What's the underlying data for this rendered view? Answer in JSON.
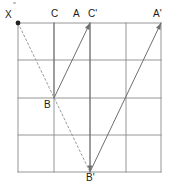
{
  "figure": {
    "canvas": {
      "width": 170,
      "height": 182,
      "background": "#ffffff"
    },
    "grid": {
      "x_lines": [
        18,
        54,
        90,
        126,
        161
      ],
      "y_lines": [
        23,
        60,
        98,
        135,
        172
      ],
      "columns": 4,
      "rows": 4,
      "stroke": "#8a8a8a",
      "stroke_width": 0.9
    },
    "points": [
      {
        "id": "X",
        "label": "X",
        "x": 18,
        "y": 23,
        "dot": true,
        "label_dx": -13,
        "label_dy": -13
      },
      {
        "id": "C",
        "label": "C",
        "x": 54,
        "y": 23,
        "dot": false,
        "label_dx": -3,
        "label_dy": -14
      },
      {
        "id": "A",
        "label": "A",
        "x": 90,
        "y": 23,
        "dot": false,
        "label_dx": -17,
        "label_dy": -14
      },
      {
        "id": "Cp",
        "label": "C'",
        "x": 90,
        "y": 23,
        "dot": false,
        "label_dx": -2,
        "label_dy": -14
      },
      {
        "id": "Ap",
        "label": "A'",
        "x": 161,
        "y": 23,
        "dot": false,
        "label_dx": -8,
        "label_dy": -14
      },
      {
        "id": "B",
        "label": "B",
        "x": 54,
        "y": 98,
        "dot": false,
        "label_dx": -10,
        "label_dy": 2
      },
      {
        "id": "Bp",
        "label": "B'",
        "x": 90,
        "y": 172,
        "dot": false,
        "label_dx": -4,
        "label_dy": 1
      }
    ],
    "segments": [
      {
        "id": "C-B",
        "from": "C",
        "to": "B",
        "style": "solid",
        "stroke": "#6f6f6f",
        "width": 1.0
      },
      {
        "id": "B-A",
        "from": "B",
        "to": "A",
        "style": "solid",
        "stroke": "#6f6f6f",
        "width": 1.0
      },
      {
        "id": "Cp-Bp",
        "from": "Cp",
        "to": "Bp",
        "style": "solid",
        "stroke": "#6f6f6f",
        "width": 1.0
      },
      {
        "id": "Bp-Ap",
        "from": "Bp",
        "to": "Ap",
        "style": "solid",
        "stroke": "#6f6f6f",
        "width": 1.0
      },
      {
        "id": "X-Bp",
        "from": "X",
        "to": "Bp",
        "style": "dashed",
        "stroke": "#9a9a9a",
        "width": 1.0,
        "dash": "2,2.4"
      }
    ],
    "markers": {
      "vertex_dot": {
        "point": "X",
        "radius": 2.4,
        "fill": "#222222"
      },
      "arrowheads": [
        {
          "id": "arrow-at-A",
          "at": "A",
          "from": "B"
        },
        {
          "id": "arrow-at-Ap",
          "at": "Ap",
          "from": "Bp"
        },
        {
          "id": "arrow-at-Bp",
          "at": "Bp",
          "from": "Cp"
        }
      ]
    },
    "artifacts": [
      {
        "id": "top-speck",
        "x": 13,
        "y": 2,
        "width": 4,
        "height": 3,
        "color": "#b5b5b5"
      }
    ]
  },
  "labels": {
    "X": "X",
    "C": "C",
    "A": "A",
    "C_prime": "C'",
    "A_prime": "A'",
    "B": "B",
    "B_prime": "B'"
  }
}
